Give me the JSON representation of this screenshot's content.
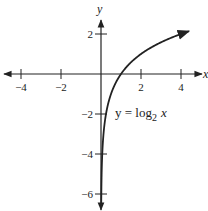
{
  "chart_data": {
    "type": "line",
    "title": "",
    "xlabel": "x",
    "ylabel": "y",
    "xlim": [
      -4.9,
      5.2
    ],
    "ylim": [
      -6.9,
      3.2
    ],
    "grid": false,
    "xticks": [
      -4,
      -2,
      2,
      4
    ],
    "xtick_labels": [
      "−4",
      "−2",
      "2",
      "4"
    ],
    "yticks": [
      2,
      -2,
      -4,
      -6
    ],
    "ytick_labels": [
      "2",
      "−2",
      "−4",
      "−6"
    ],
    "series": [
      {
        "name": "y = log2 x",
        "function": "log2(x)",
        "x": [
          0.015625,
          0.03125,
          0.0625,
          0.125,
          0.25,
          0.5,
          1,
          2,
          3,
          4,
          4.4
        ],
        "values": [
          -6,
          -5,
          -4,
          -3,
          -2,
          -1,
          0,
          1,
          1.585,
          2,
          2.14
        ]
      }
    ],
    "annotations": [
      {
        "text_main": "y = log",
        "subscript": "2",
        "text_tail": " x",
        "x": 0.9,
        "y": -2
      }
    ]
  },
  "labels": {
    "x_axis": "x",
    "y_axis": "y",
    "curve_main": "y = log",
    "curve_sub": "2",
    "curve_tail": "x"
  },
  "colors": {
    "ink": "#222222",
    "background": "#ffffff"
  }
}
